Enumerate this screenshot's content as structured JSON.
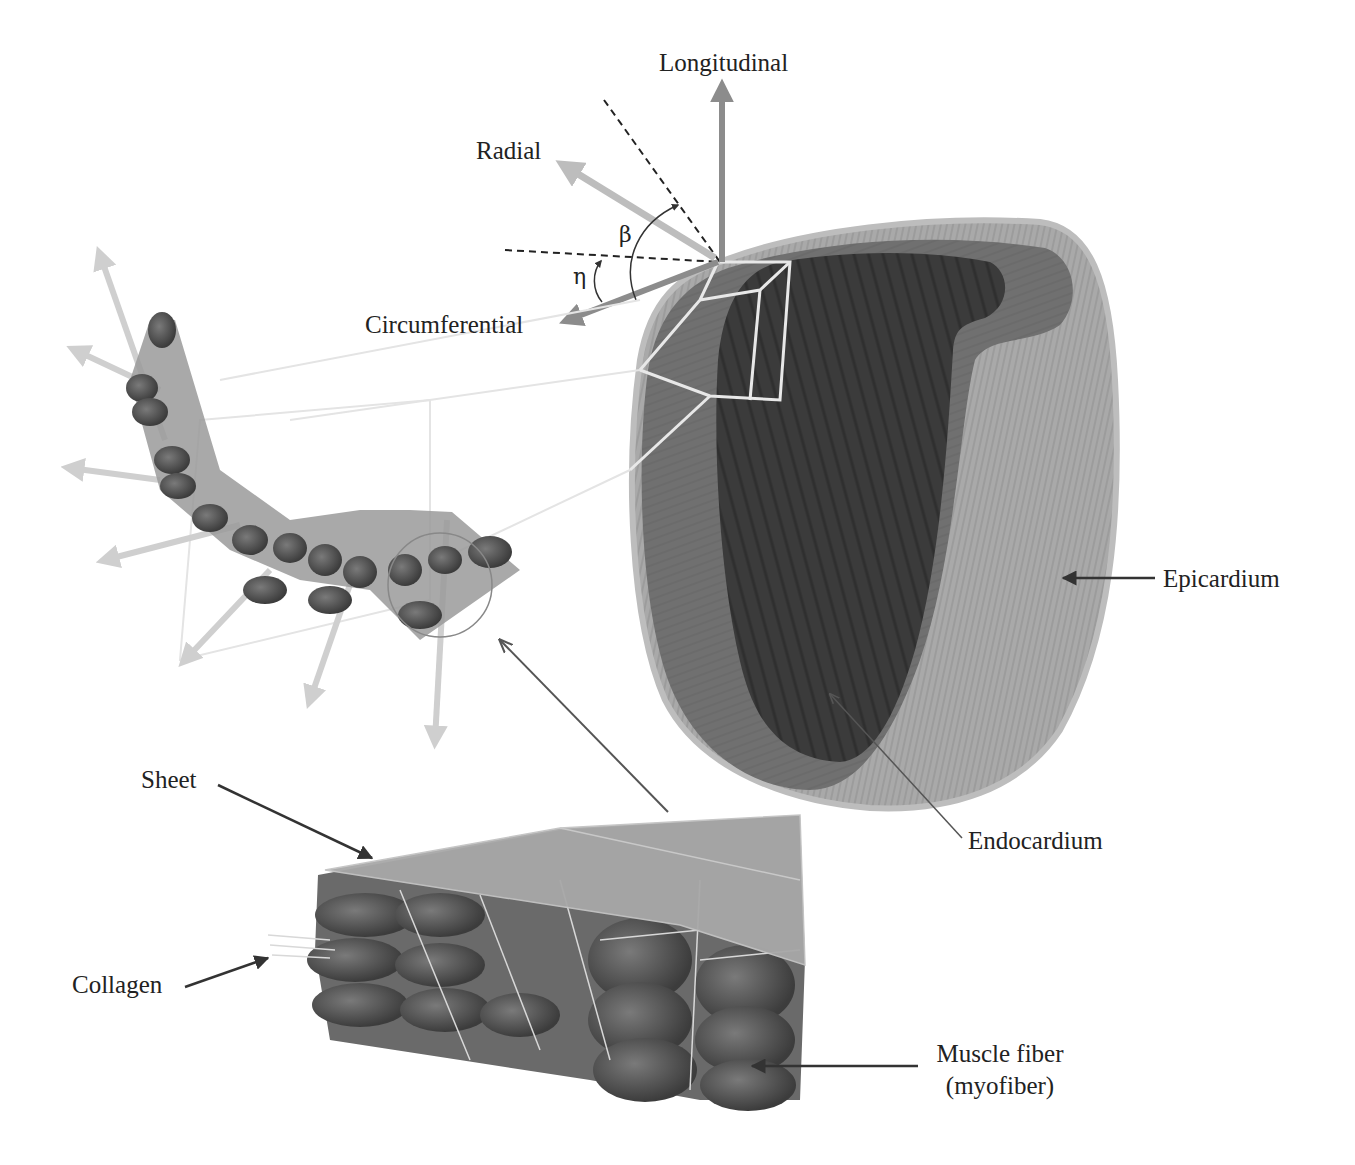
{
  "figure": {
    "axes": {
      "longitudinal": "Longitudinal",
      "radial": "Radial",
      "circumferential": "Circumferential",
      "beta": "β",
      "eta": "η"
    },
    "labels": {
      "epicardium": "Epicardium",
      "endocardium": "Endocardium",
      "sheet": "Sheet",
      "collagen": "Collagen",
      "muscle_fiber_line1": "Muscle fiber",
      "muscle_fiber_line2": "(myofiber)"
    },
    "colors": {
      "background": "#ffffff",
      "text": "#222222",
      "epicardium_surface": "#a6a6a6",
      "myocardium_wall": "#6e6e6e",
      "endocardium_cavity": "#3a3a3a",
      "light_arrow": "#c8c8c8",
      "mid_arrow": "#8a8a8a",
      "sheet_plane": "#a0a0a0",
      "fiber_dark": "#4a4a4a"
    }
  }
}
